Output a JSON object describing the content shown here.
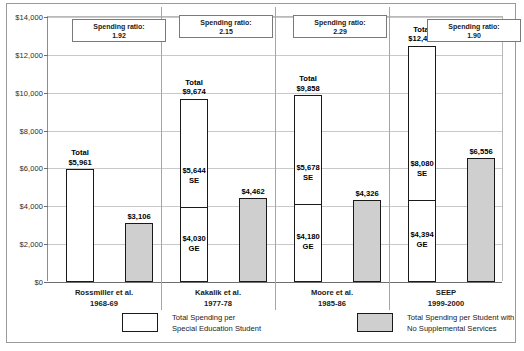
{
  "chart_data": {
    "type": "bar",
    "title": "",
    "xlabel": "",
    "ylabel": "",
    "ylim": [
      0,
      14000
    ],
    "ytick_labels": [
      "$14,000",
      "$12,000",
      "$10,000",
      "$8,000",
      "$6,000",
      "$4,000",
      "$2,000",
      "$0"
    ],
    "ytick_values": [
      14000,
      12000,
      10000,
      8000,
      6000,
      4000,
      2000,
      0
    ],
    "grid": true,
    "legend_position": "bottom",
    "categories": [
      {
        "name": "Rossmiller et al.",
        "period": "1968-69"
      },
      {
        "name": "Kakalik et al.",
        "period": "1977-78"
      },
      {
        "name": "Moore et al.",
        "period": "1985-86"
      },
      {
        "name": "SEEP",
        "period": "1999-2000"
      }
    ],
    "series": [
      {
        "name": "Total Spending per Special Education Student",
        "style": "white",
        "values": [
          5961,
          9674,
          9858,
          12474
        ],
        "value_labels": [
          "$5,961",
          "$9,674",
          "$9,858",
          "$12,474"
        ],
        "total_prefix": "Total",
        "segments": [
          {
            "ge": null,
            "se": null,
            "ge_label": "",
            "se_label": "",
            "ge_text": "",
            "se_text": ""
          },
          {
            "ge": 4030,
            "se": 5644,
            "ge_label": "$4,030",
            "se_label": "$5,644",
            "ge_text": "GE",
            "se_text": "SE"
          },
          {
            "ge": 4180,
            "se": 5678,
            "ge_label": "$4,180",
            "se_label": "$5,678",
            "ge_text": "GE",
            "se_text": "SE"
          },
          {
            "ge": 4394,
            "se": 8080,
            "ge_label": "$4,394",
            "se_label": "$8,080",
            "ge_text": "GE",
            "se_text": "SE"
          }
        ]
      },
      {
        "name": "Total Spending per Student with No Supplemental Services",
        "style": "gray",
        "values": [
          3106,
          4462,
          4326,
          6556
        ],
        "value_labels": [
          "$3,106",
          "$4,462",
          "$4,326",
          "$6,556"
        ]
      }
    ],
    "annotations": [
      {
        "label": "Spending ratio:",
        "value": "1.92"
      },
      {
        "label": "Spending ratio:",
        "value": "2.15"
      },
      {
        "label": "Spending ratio:",
        "value": "2.29"
      },
      {
        "label": "Spending ratio:",
        "value": "1.90"
      }
    ],
    "legend": [
      {
        "style": "white",
        "line1": "Total Spending per",
        "line2": "Special Education Student"
      },
      {
        "style": "gray",
        "line1": "Total Spending per Student with",
        "line2": "No Supplemental Services"
      }
    ],
    "colors": {
      "white_bar": "#ffffff",
      "gray_bar": "#cfcfcf",
      "bar_outline": "#1a1a1a",
      "gridline": "#c9c9c9",
      "axis": "#6e6e6e",
      "frame": "#9a9a9a",
      "text": "#1a1a1a"
    }
  }
}
